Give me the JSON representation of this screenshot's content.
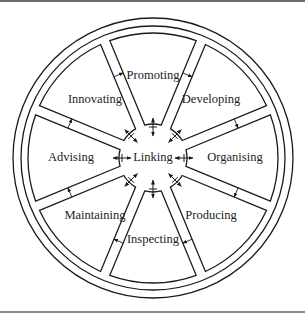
{
  "diagram": {
    "center_label": "Linking",
    "segments": [
      {
        "label": "Promoting",
        "angle": -90
      },
      {
        "label": "Developing",
        "angle": -45
      },
      {
        "label": "Organising",
        "angle": 0
      },
      {
        "label": "Producing",
        "angle": 45
      },
      {
        "label": "Inspecting",
        "angle": 90
      },
      {
        "label": "Maintaining",
        "angle": 135
      },
      {
        "label": "Advising",
        "angle": 180
      },
      {
        "label": "Innovating",
        "angle": 225
      }
    ],
    "geometry": {
      "cx": 153,
      "cy": 158,
      "outer_ring_r": 140,
      "inner_ring_r": 132,
      "segment_outer_r": 125,
      "segment_inner_r": 34,
      "gap_half_width": 5,
      "label_r": 82
    },
    "colors": {
      "stroke": "#1a1a1a",
      "text": "#222222",
      "background": "#ffffff"
    },
    "connectors": {
      "hub_arrows": "double-headed arrows between hub and each segment",
      "ring_arrows": "small clockwise arrows in each spoke gap"
    }
  }
}
